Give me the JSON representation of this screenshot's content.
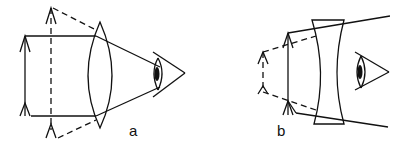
{
  "figure": {
    "panels": [
      {
        "id": "a",
        "label": "a",
        "description": "Converging (convex) lens used as magnifier: real object between lens and focal point, virtual enlarged upright image (dashed) seen by eye"
      },
      {
        "id": "b",
        "label": "b",
        "description": "Diverging (concave) lens: virtual reduced upright image (dashed) seen by eye"
      }
    ],
    "colors": {
      "ink": "#111111",
      "background": "#ffffff"
    }
  }
}
